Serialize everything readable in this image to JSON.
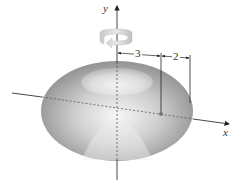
{
  "figure": {
    "type": "torus-of-revolution",
    "axes": {
      "x_label": "x",
      "y_label": "y"
    },
    "dimensions": {
      "major_radius_label": "3",
      "minor_radius_label": "2"
    },
    "icons": {
      "rotation": "rotation-arrow-icon"
    },
    "colors": {
      "surface_light": "#f4f4f4",
      "surface_dark": "#8a8a8a",
      "axis": "#333333"
    }
  }
}
